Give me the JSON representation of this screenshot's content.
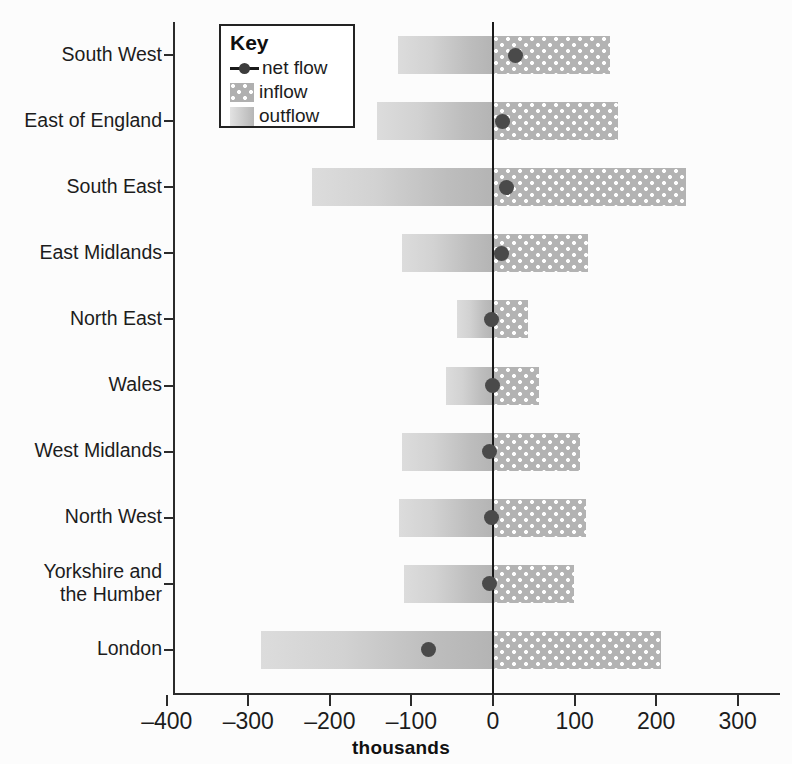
{
  "chart_data": {
    "type": "bar",
    "title": "",
    "xlabel": "thousands",
    "ylabel": "",
    "orientation": "horizontal",
    "grid": false,
    "xlim": [
      -400,
      300
    ],
    "xticks": [
      -400,
      -300,
      -200,
      -100,
      0,
      100,
      200,
      300
    ],
    "xtick_labels": [
      "–400",
      "–300",
      "–200",
      "–100",
      "0",
      "100",
      "200",
      "300"
    ],
    "categories": [
      "South West",
      "East of England",
      "South East",
      "East Midlands",
      "North East",
      "Wales",
      "West Midlands",
      "North West",
      "Yorkshire and\nthe Humber",
      "London"
    ],
    "series": [
      {
        "name": "outflow",
        "values": [
          -117,
          -142,
          -222,
          -111,
          -44,
          -58,
          -112,
          -115,
          -109,
          -284
        ]
      },
      {
        "name": "inflow",
        "values": [
          144,
          153,
          237,
          117,
          43,
          57,
          107,
          114,
          99,
          206
        ]
      },
      {
        "name": "net flow",
        "values": [
          27,
          12,
          17,
          10,
          -2,
          -1,
          -4,
          -2,
          -4,
          -79
        ]
      }
    ],
    "legend": {
      "position": "top-left",
      "title": "Key",
      "entries": [
        {
          "label": "net flow",
          "marker": "line-dot",
          "color": "#3c3c3c"
        },
        {
          "label": "inflow",
          "marker": "dotted-fill",
          "color": "#b0b0b0"
        },
        {
          "label": "outflow",
          "marker": "gradient-fill",
          "color": "#c8c8c8"
        }
      ]
    },
    "colors": {
      "outflow": "#c8c8c8",
      "inflow": "#b0b0b0",
      "net_flow": "#3c3c3c",
      "axis": "#2b2b2b",
      "background": "#ffffff"
    }
  },
  "axis": {
    "x_title": "thousands"
  }
}
